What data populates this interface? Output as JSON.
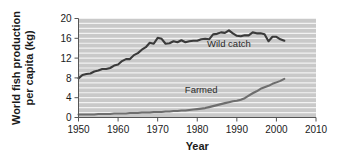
{
  "chart_data": {
    "type": "line",
    "title": "",
    "xlabel": "Year",
    "ylabel": "World fish production per capita (kg)",
    "ylabel_line1": "World fish production",
    "ylabel_line2": "per capita (kg)",
    "xlim": [
      1950,
      2010
    ],
    "ylim": [
      0,
      20
    ],
    "xticks": [
      1950,
      1960,
      1970,
      1980,
      1990,
      2000,
      2010
    ],
    "xticklabels": [
      "1950",
      "1960",
      "1970",
      "1980",
      "1990",
      "2000",
      "2010"
    ],
    "yticks": [
      0,
      4,
      8,
      12,
      16,
      20
    ],
    "yticklabels": [
      "0",
      "4",
      "8",
      "12",
      "16",
      "20"
    ],
    "grid": "horizontal-minor-white-on-gray",
    "gridline_interval": 1,
    "plot_background": "#c9c9c9",
    "gridline_color": "#f2f2f2",
    "legend_position": "inline-annotations",
    "series": [
      {
        "name": "Wild catch",
        "color": "#3a3a3a",
        "label_x": 1988,
        "label_y": 14.2,
        "x": [
          1950,
          1951,
          1952,
          1953,
          1954,
          1955,
          1956,
          1957,
          1958,
          1959,
          1960,
          1961,
          1962,
          1963,
          1964,
          1965,
          1966,
          1967,
          1968,
          1969,
          1970,
          1971,
          1972,
          1973,
          1974,
          1975,
          1976,
          1977,
          1978,
          1979,
          1980,
          1981,
          1982,
          1983,
          1984,
          1985,
          1986,
          1987,
          1988,
          1989,
          1990,
          1991,
          1992,
          1993,
          1994,
          1995,
          1996,
          1997,
          1998,
          1999,
          2000,
          2001,
          2002
        ],
        "values": [
          7.9,
          8.6,
          8.8,
          8.9,
          9.3,
          9.5,
          9.8,
          9.8,
          10.0,
          10.5,
          10.7,
          11.4,
          11.8,
          11.8,
          12.6,
          13.0,
          13.7,
          14.2,
          15.1,
          14.9,
          16.1,
          15.9,
          14.9,
          15.0,
          15.4,
          15.2,
          15.6,
          15.2,
          15.4,
          15.5,
          15.5,
          15.8,
          15.9,
          15.8,
          16.8,
          16.9,
          17.2,
          17.1,
          17.6,
          17.0,
          16.5,
          16.4,
          16.6,
          16.6,
          17.2,
          17.0,
          17.0,
          16.8,
          15.4,
          16.3,
          16.3,
          15.8,
          15.5
        ]
      },
      {
        "name": "Farmed",
        "color": "#6e6e6e",
        "label_x": 1981,
        "label_y": 5.0,
        "x": [
          1950,
          1951,
          1952,
          1953,
          1954,
          1955,
          1956,
          1957,
          1958,
          1959,
          1960,
          1961,
          1962,
          1963,
          1964,
          1965,
          1966,
          1967,
          1968,
          1969,
          1970,
          1971,
          1972,
          1973,
          1974,
          1975,
          1976,
          1977,
          1978,
          1979,
          1980,
          1981,
          1982,
          1983,
          1984,
          1985,
          1986,
          1987,
          1988,
          1989,
          1990,
          1991,
          1992,
          1993,
          1994,
          1995,
          1996,
          1997,
          1998,
          1999,
          2000,
          2001,
          2002
        ],
        "values": [
          0.6,
          0.6,
          0.6,
          0.6,
          0.6,
          0.7,
          0.7,
          0.7,
          0.7,
          0.8,
          0.8,
          0.8,
          0.8,
          0.9,
          0.9,
          0.9,
          1.0,
          1.0,
          1.0,
          1.1,
          1.1,
          1.1,
          1.2,
          1.2,
          1.3,
          1.3,
          1.4,
          1.4,
          1.5,
          1.6,
          1.7,
          1.8,
          1.9,
          2.1,
          2.3,
          2.5,
          2.7,
          2.9,
          3.1,
          3.3,
          3.4,
          3.6,
          3.9,
          4.4,
          4.9,
          5.3,
          5.8,
          6.1,
          6.4,
          6.8,
          7.1,
          7.4,
          7.8
        ]
      }
    ]
  }
}
